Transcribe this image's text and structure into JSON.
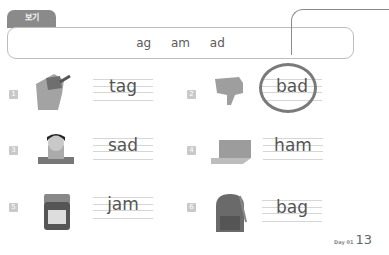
{
  "example_box": {
    "tab_label": "보기",
    "words": [
      "ag",
      "am",
      "ad"
    ]
  },
  "items": [
    {
      "number": "1",
      "picture": "plow-icon",
      "word": "tag"
    },
    {
      "number": "2",
      "picture": "thumbs-down-icon",
      "word": "bad",
      "circled": true
    },
    {
      "number": "3",
      "picture": "sad-boy-icon",
      "word": "sad"
    },
    {
      "number": "4",
      "picture": "ham-icon",
      "word": "ham"
    },
    {
      "number": "5",
      "picture": "jam-jar-icon",
      "word": "jam"
    },
    {
      "number": "6",
      "picture": "backpack-icon",
      "word": "bag"
    }
  ],
  "footer": {
    "day_label": "Day 01",
    "page_number": "13"
  }
}
